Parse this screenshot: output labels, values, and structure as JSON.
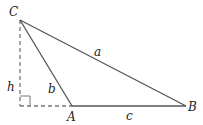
{
  "diagram": {
    "type": "triangle-with-altitude",
    "colors": {
      "stroke": "#555555",
      "dashed": "#777777",
      "text": "#222222",
      "background": "#ffffff"
    },
    "vertices": {
      "C": {
        "label": "C",
        "x": 20,
        "y": 20
      },
      "A": {
        "label": "A",
        "x": 72,
        "y": 106
      },
      "B": {
        "label": "B",
        "x": 186,
        "y": 106
      },
      "foot": {
        "x": 20,
        "y": 106
      }
    },
    "sides": {
      "a": {
        "label": "a",
        "from": "C",
        "to": "B"
      },
      "b": {
        "label": "b",
        "from": "C",
        "to": "A"
      },
      "c": {
        "label": "c",
        "from": "A",
        "to": "B"
      }
    },
    "altitude": {
      "label": "h",
      "style": "dashed"
    },
    "extension": {
      "style": "dashed",
      "from": "foot",
      "to": "A"
    },
    "right_angle_marker": true
  }
}
